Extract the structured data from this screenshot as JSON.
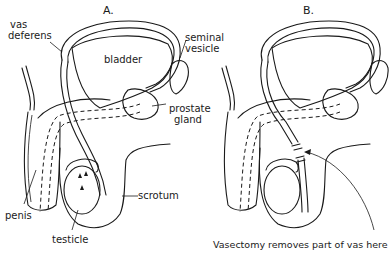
{
  "figure": {
    "panels": [
      {
        "id": "A",
        "title": "A.",
        "labels": {
          "vas_deferens_line1": "vas",
          "vas_deferens_line2": "deferens",
          "bladder": "bladder",
          "seminal_vesicle_line1": "seminal",
          "seminal_vesicle_line2": "vesicle",
          "prostate_gland_line1": "prostate",
          "prostate_gland_line2": "gland",
          "scrotum": "scrotum",
          "penis": "penis",
          "testicle": "testicle"
        }
      },
      {
        "id": "B",
        "title": "B.",
        "labels": {
          "caption": "Vasectomy removes part of vas here"
        }
      }
    ],
    "colors": {
      "ink": "#1a1a1a",
      "background": "#ffffff"
    }
  }
}
